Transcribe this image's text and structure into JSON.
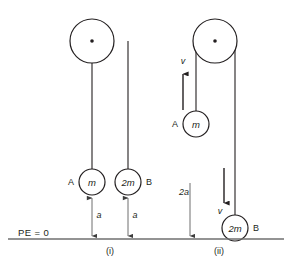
{
  "figure": {
    "title_text": "",
    "background_color": "#ffffff",
    "ink_color": "#231f20",
    "gray_color": "#6f6f6f",
    "baseline_label": "PE = 0"
  },
  "panels": [
    {
      "id": "panel-i",
      "caption": "(i)",
      "caption_x": 110,
      "caption_y": 251,
      "pulley": {
        "cx": 92,
        "cy": 41,
        "r": 22,
        "axle_r": 1.8
      },
      "ropes": [
        {
          "name": "rope-left",
          "x": 92,
          "y_top": 41,
          "y_bottom": 169
        },
        {
          "name": "rope-right",
          "x": 128,
          "y_top": 41,
          "y_bottom": 169
        }
      ],
      "masses": [
        {
          "name": "mass-a",
          "label": "m",
          "tag": "A",
          "tag_side": "left",
          "cx": 92,
          "cy": 182,
          "r": 13
        },
        {
          "name": "mass-b",
          "label": "2m",
          "tag": "B",
          "tag_side": "right",
          "cx": 128,
          "cy": 182,
          "r": 13
        }
      ],
      "dimensions": [
        {
          "name": "height-a-left",
          "label": "a",
          "x": 92,
          "y_top": 196,
          "y_bottom": 238,
          "label_x": 98,
          "label_y": 216
        },
        {
          "name": "height-a-right",
          "label": "a",
          "x": 128,
          "y_top": 196,
          "y_bottom": 238,
          "label_x": 134,
          "label_y": 216
        }
      ],
      "velocities": []
    },
    {
      "id": "panel-ii",
      "caption": "(ii)",
      "caption_x": 219,
      "caption_y": 251,
      "pulley": {
        "cx": 215,
        "cy": 41,
        "r": 22,
        "axle_r": 1.8
      },
      "ropes": [
        {
          "name": "rope-left",
          "x": 196,
          "y_top": 41,
          "y_bottom": 111
        },
        {
          "name": "rope-right",
          "x": 235,
          "y_top": 41,
          "y_bottom": 215
        }
      ],
      "masses": [
        {
          "name": "mass-a",
          "label": "m",
          "tag": "A",
          "tag_side": "left",
          "cx": 196,
          "cy": 124,
          "r": 13
        },
        {
          "name": "mass-b",
          "label": "2m",
          "tag": "B",
          "tag_side": "right",
          "cx": 235,
          "cy": 228,
          "r": 13
        }
      ],
      "dimensions": [
        {
          "name": "drop-2a",
          "label": "2a",
          "x": 190,
          "y_top": 183,
          "y_bottom": 238,
          "label_x": 183,
          "label_y": 193
        }
      ],
      "velocities": [
        {
          "name": "velocity-up",
          "label": "v",
          "x": 183,
          "y_from": 110,
          "y_to": 72,
          "label_x": 183,
          "label_y": 62
        },
        {
          "name": "velocity-down",
          "label": "v",
          "x": 224,
          "y_from": 168,
          "y_to": 205,
          "label_x": 220,
          "label_y": 212
        }
      ]
    }
  ],
  "ground": {
    "x_start": 8,
    "x_end": 284,
    "y": 239
  },
  "pe_label": {
    "text": "PE = 0",
    "x": 18,
    "y": 233
  }
}
